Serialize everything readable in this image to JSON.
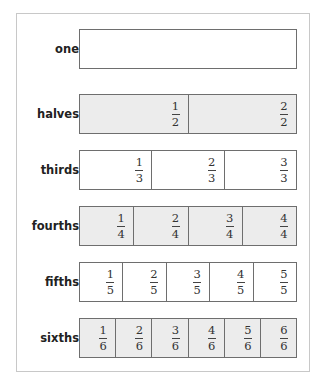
{
  "rows": [
    {
      "label": "one",
      "shaded": false,
      "cells": []
    },
    {
      "label": "halves",
      "shaded": true,
      "cells": [
        {
          "num": "1",
          "den": "2"
        },
        {
          "num": "2",
          "den": "2"
        }
      ]
    },
    {
      "label": "thirds",
      "shaded": false,
      "cells": [
        {
          "num": "1",
          "den": "3"
        },
        {
          "num": "2",
          "den": "3"
        },
        {
          "num": "3",
          "den": "3"
        }
      ]
    },
    {
      "label": "fourths",
      "shaded": true,
      "cells": [
        {
          "num": "1",
          "den": "4"
        },
        {
          "num": "2",
          "den": "4"
        },
        {
          "num": "3",
          "den": "4"
        },
        {
          "num": "4",
          "den": "4"
        }
      ]
    },
    {
      "label": "fifths",
      "shaded": false,
      "cells": [
        {
          "num": "1",
          "den": "5"
        },
        {
          "num": "2",
          "den": "5"
        },
        {
          "num": "3",
          "den": "5"
        },
        {
          "num": "4",
          "den": "5"
        },
        {
          "num": "5",
          "den": "5"
        }
      ]
    },
    {
      "label": "sixths",
      "shaded": true,
      "cells": [
        {
          "num": "1",
          "den": "6"
        },
        {
          "num": "2",
          "den": "6"
        },
        {
          "num": "3",
          "den": "6"
        },
        {
          "num": "4",
          "den": "6"
        },
        {
          "num": "5",
          "den": "6"
        },
        {
          "num": "6",
          "den": "6"
        }
      ]
    }
  ],
  "colors": {
    "shaded_fill": "#ececec",
    "plain_fill": "#ffffff",
    "border": "#6e6e6e",
    "frame_border": "#c8c8c8"
  }
}
